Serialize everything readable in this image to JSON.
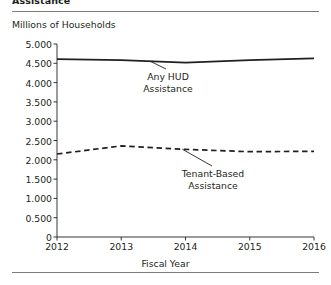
{
  "figure": {
    "title_partial": "Assistance",
    "y_axis_title": "Millions of Households",
    "x_axis_title": "Fiscal Year"
  },
  "annotations": {
    "series_a_label": "Any HUD\nAssistance",
    "series_b_label": "Tenant-Based\nAssistance"
  },
  "chart_data": {
    "type": "line",
    "title": "Assistance",
    "xlabel": "Fiscal Year",
    "ylabel": "Millions of Households",
    "x": [
      2012,
      2013,
      2014,
      2015,
      2016
    ],
    "xtick_labels": [
      "2012",
      "2013",
      "2014",
      "2015",
      "2016"
    ],
    "ytick_labels": [
      "0",
      "0.500",
      "1.000",
      "1.500",
      "2.000",
      "2.500",
      "3.000",
      "3.500",
      "4.000",
      "4.500",
      "5.000"
    ],
    "ytick_values": [
      0,
      0.5,
      1.0,
      1.5,
      2.0,
      2.5,
      3.0,
      3.5,
      4.0,
      4.5,
      5.0
    ],
    "ylim": [
      0,
      5.0
    ],
    "xlim": [
      2012,
      2016
    ],
    "grid": false,
    "legend_position": "inline-annotations",
    "series": [
      {
        "name": "Any HUD Assistance",
        "style": "solid",
        "color": "#231f20",
        "values": [
          4.61,
          4.58,
          4.52,
          4.58,
          4.63
        ]
      },
      {
        "name": "Tenant-Based Assistance",
        "style": "dashed",
        "color": "#231f20",
        "values": [
          2.15,
          2.36,
          2.27,
          2.21,
          2.22
        ]
      }
    ]
  }
}
